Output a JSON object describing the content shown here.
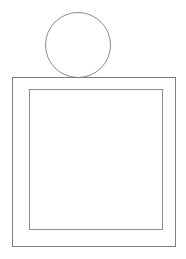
{
  "canvas": {
    "width": 186,
    "height": 259,
    "background_color": "#ffffff",
    "title": "Line Drawing"
  },
  "drawing": {
    "stroke_color": "#8c8c8c",
    "stroke_color_dark": "#6f6f6f",
    "stroke_width": 1,
    "fill": "none",
    "shapes": [
      {
        "name": "circle-head",
        "type": "circle",
        "center_x": 78,
        "center_y": 45,
        "radius": 32.5,
        "stroke_color": "#8c8c8c",
        "stroke_width": 1,
        "fill": "none"
      },
      {
        "name": "outer-square",
        "type": "rect",
        "x": 12,
        "y": 77,
        "width": 164,
        "height": 170,
        "stroke_color": "#7d7d7d",
        "stroke_width": 1,
        "fill": "none"
      },
      {
        "name": "inner-square",
        "type": "rect",
        "x": 29,
        "y": 89,
        "width": 134,
        "height": 141,
        "stroke_color": "#8c8c8c",
        "stroke_width": 1,
        "fill": "none"
      }
    ]
  },
  "labels": {
    "none": ""
  }
}
